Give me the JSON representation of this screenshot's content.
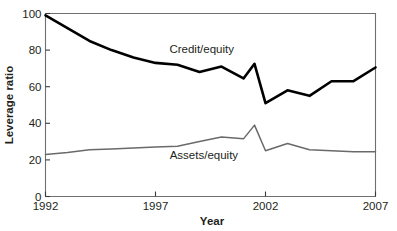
{
  "chart_data": {
    "type": "line",
    "title": "",
    "xlabel": "Year",
    "ylabel": "Leverage ratio",
    "xlim": [
      1992,
      2007
    ],
    "ylim": [
      0,
      100
    ],
    "xticks": [
      1992,
      1997,
      2002,
      2007
    ],
    "yticks": [
      0,
      20,
      40,
      60,
      80,
      100
    ],
    "grid": false,
    "legend": "inline-annotation",
    "x": [
      1992,
      1993,
      1994,
      1995,
      1996,
      1997,
      1998,
      1999,
      2000,
      2001,
      2002,
      2003,
      2004,
      2005,
      2006,
      2007
    ],
    "series": [
      {
        "name": "Credit/equity",
        "color": "#000000",
        "width": 2.6,
        "values": [
          99,
          92,
          85,
          80,
          76,
          73,
          72,
          68,
          71,
          64.5,
          51,
          58,
          55,
          63,
          63,
          70.5
        ],
        "extra_points": [
          {
            "x": 2001.5,
            "y": 72.5
          }
        ],
        "label_x": 1999.1,
        "label_y": 80.5
      },
      {
        "name": "Assets/equity",
        "color": "#6a6a6a",
        "width": 1.5,
        "values": [
          23,
          24,
          25.5,
          26,
          26.5,
          27,
          27.5,
          30,
          32.5,
          31.5,
          25,
          29,
          25.5,
          25,
          24.5,
          24.5
        ],
        "extra_points": [
          {
            "x": 2001.5,
            "y": 39
          }
        ],
        "label_x": 1999.2,
        "label_y": 22.5
      }
    ]
  },
  "axis": {
    "y_tick_labels": [
      "0",
      "20",
      "40",
      "60",
      "80",
      "100"
    ],
    "x_tick_labels": [
      "1992",
      "1997",
      "2002",
      "2007"
    ],
    "x_title": "Year",
    "y_title": "Leverage ratio"
  },
  "annotations": {
    "credit_label": "Credit/equity",
    "assets_label": "Assets/equity"
  }
}
